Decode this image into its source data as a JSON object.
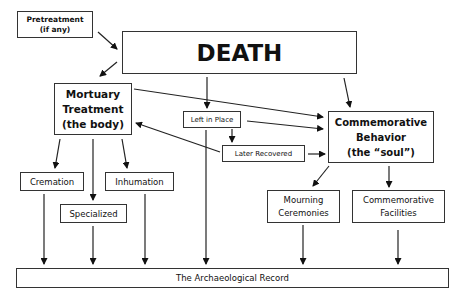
{
  "diagram": {
    "nodes": {
      "pretreatment": {
        "line1": "Pretreatment",
        "line2": "(if any)"
      },
      "death": {
        "label": "DEATH"
      },
      "mortuary": {
        "line1": "Mortuary",
        "line2": "Treatment",
        "line3": "(the body)"
      },
      "commemorative_behavior": {
        "line1": "Commemorative",
        "line2": "Behavior",
        "line3": "(the “soul”)"
      },
      "left_in_place": {
        "label": "Left in Place"
      },
      "later_recovered": {
        "label": "Later Recovered"
      },
      "cremation": {
        "label": "Cremation"
      },
      "inhumation": {
        "label": "Inhumation"
      },
      "specialized": {
        "label": "Specialized"
      },
      "mourning": {
        "line1": "Mourning",
        "line2": "Ceremonies"
      },
      "facilities": {
        "line1": "Commemorative",
        "line2": "Facilities"
      },
      "record": {
        "label": "The Archaeological Record"
      }
    },
    "edges": [
      {
        "from": "pretreatment",
        "to": "death"
      },
      {
        "from": "death",
        "to": "mortuary"
      },
      {
        "from": "death",
        "to": "left_in_place"
      },
      {
        "from": "death",
        "to": "commemorative_behavior"
      },
      {
        "from": "mortuary",
        "to": "commemorative_behavior"
      },
      {
        "from": "left_in_place",
        "to": "commemorative_behavior"
      },
      {
        "from": "left_in_place",
        "to": "later_recovered"
      },
      {
        "from": "later_recovered",
        "to": "mortuary"
      },
      {
        "from": "later_recovered",
        "to": "commemorative_behavior"
      },
      {
        "from": "left_in_place",
        "to": "record"
      },
      {
        "from": "mortuary",
        "to": "cremation"
      },
      {
        "from": "mortuary",
        "to": "specialized"
      },
      {
        "from": "mortuary",
        "to": "inhumation"
      },
      {
        "from": "commemorative_behavior",
        "to": "mourning"
      },
      {
        "from": "commemorative_behavior",
        "to": "facilities"
      },
      {
        "from": "cremation",
        "to": "record"
      },
      {
        "from": "specialized",
        "to": "record"
      },
      {
        "from": "inhumation",
        "to": "record"
      },
      {
        "from": "mourning",
        "to": "record"
      },
      {
        "from": "facilities",
        "to": "record"
      }
    ]
  }
}
